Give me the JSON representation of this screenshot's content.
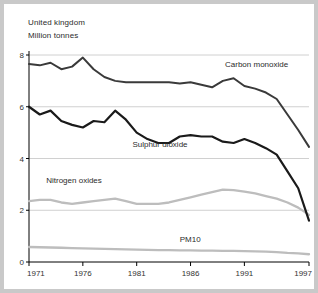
{
  "header": {
    "country": "United kingdom",
    "units": "Million tonnes"
  },
  "chart_data": {
    "type": "line",
    "title": "United kingdom",
    "subtitle": "Million tonnes",
    "xlabel": "",
    "ylabel": "Million tonnes",
    "xlim": [
      1971,
      1997
    ],
    "ylim": [
      0,
      8
    ],
    "yticks": [
      0,
      2,
      4,
      6,
      8
    ],
    "ytick_labels": [
      "0",
      "2",
      "4",
      "6",
      "8"
    ],
    "xticks": [
      1971,
      1976,
      1981,
      1986,
      1991,
      1997
    ],
    "xtick_labels": [
      "1971",
      "1976",
      "1981",
      "1986",
      "1991",
      "1997"
    ],
    "grid": "horizontal",
    "legend": "inline-labels",
    "x": [
      1971,
      1972,
      1973,
      1974,
      1975,
      1976,
      1977,
      1978,
      1979,
      1980,
      1981,
      1982,
      1983,
      1984,
      1985,
      1986,
      1987,
      1988,
      1989,
      1990,
      1991,
      1992,
      1993,
      1994,
      1995,
      1996,
      1997
    ],
    "series": [
      {
        "name": "Carbon monoxide",
        "color": "#3a3a3a",
        "width": 2.0,
        "label_x": 1989.2,
        "label_y": 7.55,
        "values": [
          7.65,
          7.6,
          7.7,
          7.45,
          7.55,
          7.9,
          7.45,
          7.15,
          7.0,
          6.95,
          6.95,
          6.95,
          6.95,
          6.95,
          6.9,
          6.95,
          6.85,
          6.75,
          7.0,
          7.1,
          6.8,
          6.7,
          6.55,
          6.3,
          5.7,
          5.1,
          4.45
        ]
      },
      {
        "name": "Sulphur dioxide",
        "color": "#1a1a1a",
        "width": 2.2,
        "label_x": 1980.6,
        "label_y": 4.45,
        "values": [
          6.0,
          5.7,
          5.85,
          5.45,
          5.3,
          5.2,
          5.45,
          5.4,
          5.85,
          5.5,
          5.0,
          4.75,
          4.6,
          4.6,
          4.85,
          4.9,
          4.85,
          4.85,
          4.65,
          4.6,
          4.75,
          4.6,
          4.4,
          4.15,
          3.5,
          2.85,
          1.6
        ]
      },
      {
        "name": "Nitrogen oxides",
        "color": "#bdbdbd",
        "width": 2.3,
        "label_x": 1972.6,
        "label_y": 3.05,
        "values": [
          2.35,
          2.4,
          2.4,
          2.3,
          2.25,
          2.3,
          2.35,
          2.4,
          2.45,
          2.35,
          2.25,
          2.25,
          2.25,
          2.3,
          2.4,
          2.5,
          2.6,
          2.7,
          2.8,
          2.78,
          2.72,
          2.65,
          2.55,
          2.45,
          2.3,
          2.1,
          1.82
        ]
      },
      {
        "name": "PM10",
        "color": "#bdbdbd",
        "width": 2.3,
        "label_x": 1985.0,
        "label_y": 0.76,
        "values": [
          0.58,
          0.57,
          0.56,
          0.55,
          0.54,
          0.53,
          0.52,
          0.51,
          0.5,
          0.49,
          0.48,
          0.47,
          0.46,
          0.46,
          0.45,
          0.45,
          0.44,
          0.44,
          0.43,
          0.43,
          0.42,
          0.41,
          0.4,
          0.38,
          0.35,
          0.33,
          0.3
        ]
      }
    ]
  },
  "style": {
    "panel_bg": "#ffffff",
    "page_bg": "#c9c9c9",
    "grid_color": "#c4c4c4",
    "axis_color": "#000000",
    "text_color": "#2b2b2b"
  }
}
